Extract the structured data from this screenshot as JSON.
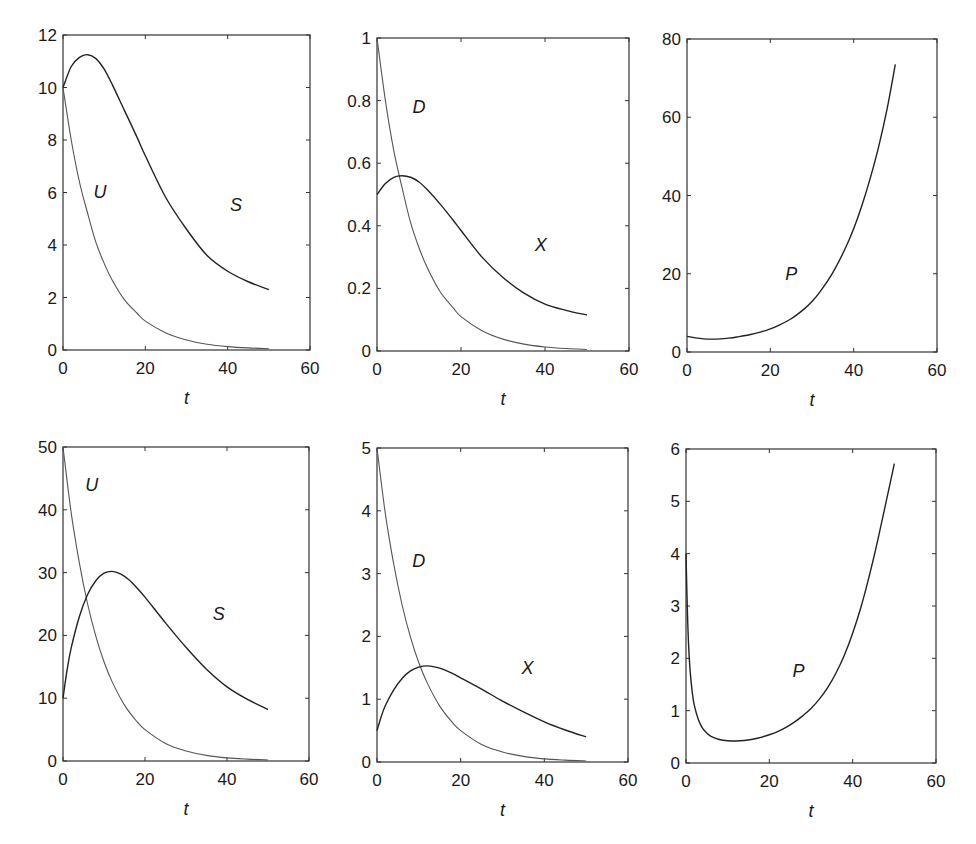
{
  "figure": {
    "layout": "2 rows x 3 columns",
    "colors": {
      "background": "#ffffff",
      "axes": "#333333",
      "curve_dark": "#222222",
      "curve_light": "#555555",
      "text": "#1a1a1a"
    }
  },
  "chart_data": [
    {
      "id": "top-left",
      "type": "line",
      "title": "",
      "xlabel": "t",
      "ylabel": "",
      "xlim": [
        0,
        60
      ],
      "ylim": [
        0,
        12
      ],
      "xticks": [
        "0",
        "20",
        "40",
        "60"
      ],
      "yticks": [
        "0",
        "2",
        "4",
        "6",
        "8",
        "10",
        "12"
      ],
      "grid": false,
      "box": {
        "left": 63,
        "top": 35,
        "right": 310,
        "bottom": 350
      },
      "series": [
        {
          "name": "U",
          "shade": "light",
          "label_pos": [
            9,
            5.8
          ],
          "x": [
            0,
            2,
            4,
            6,
            8,
            10,
            12,
            15,
            18,
            20,
            25,
            30,
            35,
            40,
            45,
            50
          ],
          "y": [
            10,
            8.0,
            6.4,
            5.2,
            4.1,
            3.3,
            2.65,
            1.9,
            1.4,
            1.1,
            0.65,
            0.38,
            0.22,
            0.13,
            0.08,
            0.05
          ]
        },
        {
          "name": "S",
          "shade": "dark",
          "label_pos": [
            42,
            5.3
          ],
          "x": [
            0,
            2,
            4,
            6,
            8,
            10,
            12,
            15,
            18,
            20,
            25,
            30,
            35,
            40,
            45,
            50
          ],
          "y": [
            10,
            10.8,
            11.15,
            11.25,
            11.1,
            10.7,
            10.1,
            9.1,
            8.1,
            7.4,
            5.8,
            4.6,
            3.6,
            3.0,
            2.6,
            2.3
          ]
        }
      ]
    },
    {
      "id": "top-middle",
      "type": "line",
      "title": "",
      "xlabel": "t",
      "ylabel": "",
      "xlim": [
        0,
        60
      ],
      "ylim": [
        0,
        1
      ],
      "xticks": [
        "0",
        "20",
        "40",
        "60"
      ],
      "yticks": [
        "0",
        "0.2",
        "0.4",
        "0.6",
        "0.8",
        "1"
      ],
      "grid": false,
      "box": {
        "left": 377,
        "top": 38,
        "right": 629,
        "bottom": 351
      },
      "series": [
        {
          "name": "D",
          "shade": "light",
          "label_pos": [
            10,
            0.76
          ],
          "x": [
            0,
            2,
            4,
            6,
            8,
            10,
            12,
            15,
            18,
            20,
            25,
            30,
            35,
            40,
            45,
            50
          ],
          "y": [
            1,
            0.8,
            0.64,
            0.52,
            0.41,
            0.33,
            0.265,
            0.19,
            0.14,
            0.11,
            0.065,
            0.038,
            0.022,
            0.013,
            0.008,
            0.005
          ]
        },
        {
          "name": "X",
          "shade": "dark",
          "label_pos": [
            39,
            0.32
          ],
          "x": [
            0,
            2,
            4,
            6,
            8,
            10,
            12,
            15,
            18,
            20,
            25,
            30,
            35,
            40,
            45,
            50
          ],
          "y": [
            0.5,
            0.535,
            0.555,
            0.56,
            0.555,
            0.54,
            0.515,
            0.47,
            0.42,
            0.385,
            0.3,
            0.235,
            0.185,
            0.15,
            0.13,
            0.115
          ]
        }
      ]
    },
    {
      "id": "top-right",
      "type": "line",
      "title": "",
      "xlabel": "t",
      "ylabel": "",
      "xlim": [
        0,
        60
      ],
      "ylim": [
        0,
        80
      ],
      "xticks": [
        "0",
        "20",
        "40",
        "60"
      ],
      "yticks": [
        "0",
        "20",
        "40",
        "60",
        "80"
      ],
      "grid": false,
      "box": {
        "left": 687,
        "top": 39,
        "right": 937,
        "bottom": 352
      },
      "series": [
        {
          "name": "P",
          "shade": "dark",
          "label_pos": [
            25,
            18.5
          ],
          "x": [
            0,
            2,
            4,
            6,
            8,
            10,
            12,
            15,
            18,
            20,
            22,
            25,
            28,
            30,
            32,
            35,
            38,
            40,
            42,
            44,
            46,
            48,
            50
          ],
          "y": [
            4.0,
            3.6,
            3.35,
            3.3,
            3.35,
            3.55,
            3.85,
            4.4,
            5.2,
            5.9,
            6.8,
            8.5,
            10.9,
            12.9,
            15.5,
            20.3,
            26.5,
            31.5,
            37.5,
            44.5,
            52.5,
            62.0,
            73.5
          ]
        }
      ]
    },
    {
      "id": "bottom-left",
      "type": "line",
      "title": "",
      "xlabel": "t",
      "ylabel": "",
      "xlim": [
        0,
        60
      ],
      "ylim": [
        0,
        50
      ],
      "xticks": [
        "0",
        "20",
        "40",
        "60"
      ],
      "yticks": [
        "0",
        "10",
        "20",
        "30",
        "40",
        "50"
      ],
      "grid": false,
      "box": {
        "left": 63,
        "top": 447,
        "right": 309,
        "bottom": 761
      },
      "series": [
        {
          "name": "U",
          "shade": "light",
          "label_pos": [
            7,
            43
          ],
          "x": [
            0,
            2,
            4,
            6,
            8,
            10,
            12,
            15,
            18,
            20,
            25,
            30,
            35,
            40,
            45,
            50
          ],
          "y": [
            50,
            39.5,
            31.5,
            25.0,
            19.9,
            15.8,
            12.6,
            8.9,
            6.3,
            5.0,
            2.8,
            1.6,
            0.9,
            0.5,
            0.3,
            0.17
          ]
        },
        {
          "name": "S",
          "shade": "dark",
          "label_pos": [
            38,
            22.5
          ],
          "x": [
            0,
            1,
            2,
            4,
            6,
            8,
            10,
            12,
            14,
            16,
            18,
            20,
            25,
            30,
            35,
            40,
            45,
            50
          ],
          "y": [
            10,
            14.5,
            18.0,
            23.0,
            26.5,
            28.7,
            29.9,
            30.2,
            29.8,
            28.9,
            27.6,
            26.1,
            22.0,
            18.1,
            14.6,
            11.8,
            9.8,
            8.2
          ]
        }
      ]
    },
    {
      "id": "bottom-middle",
      "type": "line",
      "title": "",
      "xlabel": "t",
      "ylabel": "",
      "xlim": [
        0,
        60
      ],
      "ylim": [
        0,
        5
      ],
      "xticks": [
        "0",
        "20",
        "40",
        "60"
      ],
      "yticks": [
        "0",
        "1",
        "2",
        "3",
        "4",
        "5"
      ],
      "grid": false,
      "box": {
        "left": 377,
        "top": 448,
        "right": 628,
        "bottom": 762
      },
      "series": [
        {
          "name": "D",
          "shade": "light",
          "label_pos": [
            10,
            3.1
          ],
          "x": [
            0,
            2,
            4,
            6,
            8,
            10,
            12,
            15,
            18,
            20,
            25,
            30,
            35,
            40,
            45,
            50
          ],
          "y": [
            5,
            3.95,
            3.15,
            2.5,
            1.99,
            1.58,
            1.26,
            0.89,
            0.63,
            0.5,
            0.28,
            0.16,
            0.09,
            0.05,
            0.03,
            0.017
          ]
        },
        {
          "name": "X",
          "shade": "dark",
          "label_pos": [
            36,
            1.4
          ],
          "x": [
            0,
            1,
            2,
            4,
            6,
            8,
            10,
            12,
            14,
            16,
            18,
            20,
            25,
            30,
            35,
            40,
            45,
            50
          ],
          "y": [
            0.5,
            0.72,
            0.9,
            1.15,
            1.33,
            1.45,
            1.51,
            1.53,
            1.51,
            1.47,
            1.41,
            1.34,
            1.16,
            0.97,
            0.8,
            0.64,
            0.51,
            0.4
          ]
        }
      ]
    },
    {
      "id": "bottom-right",
      "type": "line",
      "title": "",
      "xlabel": "t",
      "ylabel": "",
      "xlim": [
        0,
        60
      ],
      "ylim": [
        0,
        6
      ],
      "xticks": [
        "0",
        "20",
        "40",
        "60"
      ],
      "yticks": [
        "0",
        "1",
        "2",
        "3",
        "4",
        "5",
        "6"
      ],
      "grid": false,
      "box": {
        "left": 686,
        "top": 449,
        "right": 936,
        "bottom": 763
      },
      "series": [
        {
          "name": "P",
          "shade": "dark",
          "label_pos": [
            27,
            1.65
          ],
          "x": [
            0,
            0.3,
            0.6,
            1,
            1.5,
            2,
            3,
            4,
            5,
            6,
            8,
            10,
            12,
            14,
            16,
            18,
            20,
            22,
            24,
            26,
            28,
            30,
            32,
            34,
            36,
            38,
            40,
            42,
            44,
            46,
            48,
            50
          ],
          "y": [
            4.0,
            3.0,
            2.3,
            1.75,
            1.35,
            1.1,
            0.82,
            0.66,
            0.57,
            0.51,
            0.45,
            0.425,
            0.42,
            0.43,
            0.455,
            0.49,
            0.54,
            0.6,
            0.68,
            0.78,
            0.9,
            1.04,
            1.22,
            1.44,
            1.72,
            2.06,
            2.48,
            2.98,
            3.58,
            4.25,
            4.98,
            5.72
          ]
        }
      ]
    }
  ]
}
